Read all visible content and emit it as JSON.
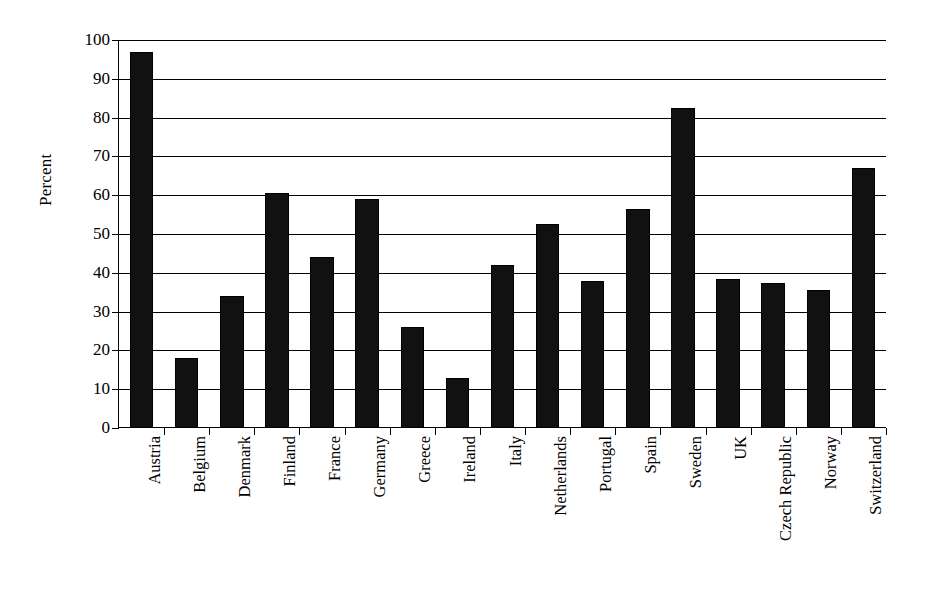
{
  "chart_data": {
    "type": "bar",
    "title": "",
    "subtitle": "",
    "xlabel": "",
    "ylabel": "Percent",
    "ylim": [
      0,
      100
    ],
    "ytick_step": 10,
    "yticks": [
      "100",
      "90",
      "80",
      "70",
      "60",
      "50",
      "40",
      "30",
      "20",
      "10",
      "0"
    ],
    "grid": "horizontal",
    "legend": "none",
    "bar_color": "#111111",
    "categories": [
      "Austria",
      "Belgium",
      "Denmark",
      "Finland",
      "France",
      "Germany",
      "Greece",
      "Ireland",
      "Italy",
      "Netherlands",
      "Portugal",
      "Spain",
      "Sweden",
      "UK",
      "Czech Republic",
      "Norway",
      "Switzerland"
    ],
    "values": [
      97,
      18,
      34,
      60.5,
      44,
      59,
      26,
      13,
      42,
      52.5,
      38,
      56.5,
      82.5,
      38.5,
      37.5,
      35.5,
      67
    ]
  }
}
